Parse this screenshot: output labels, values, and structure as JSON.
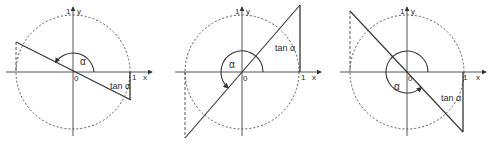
{
  "figure": {
    "panels": [
      {
        "id": "panel-1",
        "labels": {
          "y_tick": "1",
          "y_axis": "y",
          "x_tick": "1",
          "x_axis": "x",
          "origin": "0",
          "angle": "α",
          "tangent": "tan α"
        },
        "alpha_deg": 153,
        "geometry": {
          "ox": 73,
          "oy": 72,
          "r": 57,
          "line": [
            16,
            42,
            131,
            100
          ],
          "tan_seg": [
            130,
            72,
            130,
            100
          ],
          "proj_seg": [
            16,
            42,
            16,
            72
          ],
          "arc_r": 21
        },
        "label_pos": {
          "angle": [
            80,
            64
          ],
          "tangent": [
            112,
            88
          ]
        }
      },
      {
        "id": "panel-2",
        "labels": {
          "y_tick": "1",
          "y_axis": "y",
          "x_tick": "1",
          "x_axis": "x",
          "origin": "0",
          "angle": "α",
          "tangent": "tan α"
        },
        "alpha_deg": 229,
        "geometry": {
          "ox": 242,
          "oy": 72,
          "r": 57,
          "line": [
            185,
            138,
            300,
            5
          ],
          "tan_seg": [
            300,
            72,
            300,
            5
          ],
          "proj_seg": [
            185,
            72,
            185,
            138
          ],
          "arc_r": 21
        },
        "label_pos": {
          "angle": [
            229,
            66
          ],
          "tangent": [
            276,
            50
          ]
        }
      },
      {
        "id": "panel-3",
        "labels": {
          "y_tick": "1",
          "y_axis": "y",
          "x_tick": "1",
          "x_axis": "x",
          "origin": "0",
          "angle": "α",
          "tangent": "tan α"
        },
        "alpha_deg": 313,
        "geometry": {
          "ox": 407,
          "oy": 72,
          "r": 57,
          "line": [
            350,
            11,
            463,
            132
          ],
          "tan_seg": [
            463,
            72,
            463,
            132
          ],
          "proj_seg": [
            350,
            11,
            350,
            72
          ],
          "arc_r": 21
        },
        "label_pos": {
          "angle": [
            394,
            88
          ],
          "tangent": [
            441,
            100
          ]
        }
      }
    ]
  }
}
